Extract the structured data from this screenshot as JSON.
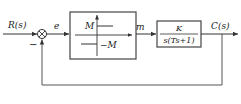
{
  "diagram": {
    "type": "block-diagram",
    "input_label": "R(s)",
    "output_label": "C(s)",
    "error_label": "e",
    "control_label": "m",
    "summing_junction": {
      "feedback_sign": "−"
    },
    "relay_block": {
      "upper_level": "M",
      "lower_level": "−M"
    },
    "plant_block": {
      "numerator": "K",
      "denominator": "s(Ts+1)"
    },
    "colors": {
      "line": "#333333",
      "background": "#ffffff"
    }
  }
}
